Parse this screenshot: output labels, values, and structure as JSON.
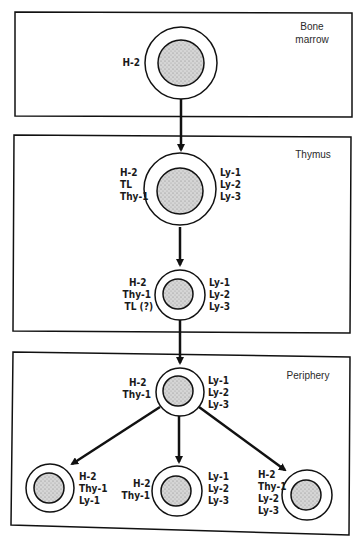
{
  "diagram": {
    "regions": [
      {
        "id": "bone-marrow",
        "label_lines": [
          "Bone",
          "marrow"
        ]
      },
      {
        "id": "thymus",
        "label_lines": [
          "Thymus"
        ]
      },
      {
        "id": "periphery",
        "label_lines": [
          "Periphery"
        ]
      }
    ],
    "cells": {
      "bone_marrow_stem": {
        "left": [
          "H-2"
        ],
        "right": []
      },
      "thymus_cortical": {
        "left": [
          "H-2",
          "TL",
          "Thy-1"
        ],
        "right": [
          "Ly-1",
          "Ly-2",
          "Ly-3"
        ]
      },
      "thymus_medullary": {
        "left": [
          "H-2",
          "Thy-1",
          "TL  (?)"
        ],
        "right": [
          "Ly-1",
          "Ly-2",
          "Ly-3"
        ]
      },
      "periphery_precursor": {
        "left": [
          "H-2",
          "Thy-1"
        ],
        "right": [
          "Ly-1",
          "Ly-2",
          "Ly-3"
        ]
      },
      "periphery_ly1": {
        "left": [],
        "right": [
          "H-2",
          "Thy-1",
          "Ly-1"
        ]
      },
      "periphery_ly123": {
        "left": [
          "H-2",
          "Thy-1"
        ],
        "right": [
          "Ly-1",
          "Ly-2",
          "Ly-3"
        ]
      },
      "periphery_ly23": {
        "left": [
          "H-2",
          "Thy-1",
          "Ly-2",
          "Ly-3"
        ],
        "right": []
      }
    },
    "colors": {
      "line": "#111111",
      "nucleus": "#c8c8c8",
      "background": "#ffffff"
    }
  }
}
